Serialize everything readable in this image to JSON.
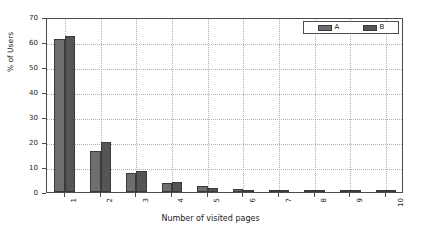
{
  "chart_data": {
    "type": "bar",
    "title": "",
    "xlabel": "Number of visited pages",
    "ylabel": "% of Users",
    "categories": [
      "1",
      "2",
      "3",
      "4",
      "5",
      "6",
      "7",
      "8",
      "9",
      "10"
    ],
    "series": [
      {
        "name": "A",
        "color": "#6e6e6e",
        "values": [
          61.2,
          16.5,
          7.5,
          3.7,
          2.3,
          1.4,
          1.0,
          0.7,
          0.6,
          0.3
        ]
      },
      {
        "name": "B",
        "color": "#555555",
        "values": [
          62.4,
          19.9,
          8.5,
          4.0,
          1.8,
          0.9,
          0.4,
          0.3,
          0.2,
          0.2
        ]
      }
    ],
    "ylim": [
      0,
      70
    ],
    "yticks": [
      0,
      10,
      20,
      30,
      40,
      50,
      60,
      70
    ],
    "ytick_labels": [
      "0",
      "10",
      "20",
      "30",
      "40",
      "50",
      "60",
      "70"
    ],
    "xtick_labels": [
      "1",
      "2",
      "3",
      "4",
      "5",
      "6",
      "7",
      "8",
      "9",
      "10"
    ],
    "grid": true,
    "grid_style": "dotted",
    "grid_color": "#b0b0b0",
    "legend": {
      "position": "upper right",
      "entries": [
        {
          "label": "A",
          "color": "#6e6e6e"
        },
        {
          "label": "B",
          "color": "#555555"
        }
      ]
    },
    "axis_color": "#4d4d4d",
    "background": "#ffffff"
  }
}
